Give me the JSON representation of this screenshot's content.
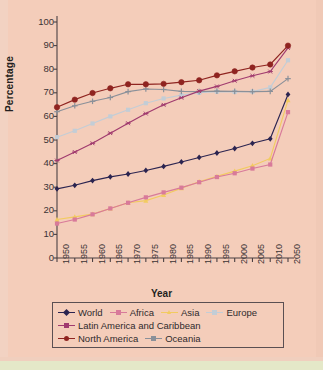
{
  "chart_data": {
    "type": "line",
    "title": "",
    "xlabel": "Year",
    "ylabel": "Percentage",
    "ylim": [
      0,
      100
    ],
    "ytick_step": 10,
    "yticks": [
      0,
      10,
      20,
      30,
      40,
      50,
      60,
      70,
      80,
      90,
      100
    ],
    "grid": false,
    "legend_position": "bottom",
    "categories": [
      "1950",
      "1955",
      "1960",
      "1965",
      "1970",
      "1975",
      "1980",
      "1985",
      "1990",
      "1995",
      "2000",
      "2005",
      "2010",
      "2050"
    ],
    "series": [
      {
        "name": "World",
        "color": "#2b2450",
        "marker": "diamond",
        "values": [
          29.3,
          30.8,
          32.8,
          34.4,
          35.6,
          37.1,
          38.8,
          40.7,
          42.6,
          44.5,
          46.4,
          48.6,
          50.5,
          69.3
        ]
      },
      {
        "name": "Africa",
        "color": "#d87a9a",
        "marker": "square",
        "values": [
          14.6,
          16.3,
          18.5,
          21.0,
          23.4,
          25.7,
          27.8,
          29.8,
          32.1,
          34.3,
          35.9,
          37.9,
          39.6,
          61.8
        ]
      },
      {
        "name": "Asia",
        "color": "#f2cb60",
        "marker": "triangle",
        "values": [
          16.3,
          17.4,
          18.6,
          21.0,
          23.4,
          24.3,
          26.7,
          29.6,
          32.3,
          34.6,
          36.8,
          39.1,
          42.2,
          66.9
        ]
      },
      {
        "name": "Europe",
        "color": "#c3cdd6",
        "marker": "square",
        "values": [
          51.2,
          53.9,
          57.0,
          60.0,
          62.8,
          65.6,
          67.6,
          69.0,
          70.0,
          70.5,
          70.4,
          70.5,
          72.3,
          83.8
        ]
      },
      {
        "name": "Latin America and Caribbean",
        "color": "#a03a6e",
        "marker": "star",
        "values": [
          41.3,
          44.9,
          48.6,
          52.9,
          57.1,
          61.2,
          64.9,
          67.9,
          70.7,
          72.7,
          75.1,
          77.2,
          79.0,
          89.0
        ]
      },
      {
        "name": "North America",
        "color": "#8f2420",
        "marker": "circle",
        "values": [
          63.9,
          67.1,
          69.9,
          71.9,
          73.6,
          73.6,
          73.8,
          74.5,
          75.3,
          77.4,
          79.1,
          80.7,
          82.0,
          90.0
        ]
      },
      {
        "name": "Oceania",
        "color": "#8a9099",
        "marker": "plus",
        "values": [
          62.0,
          64.5,
          66.4,
          68.0,
          70.5,
          71.6,
          71.4,
          70.6,
          70.5,
          70.7,
          70.6,
          70.5,
          70.6,
          76.0
        ]
      }
    ]
  },
  "axes": {
    "y_title": "Percentage",
    "x_title": "Year"
  },
  "legend": {
    "rows": [
      [
        {
          "label": "World",
          "color": "#2b2450",
          "marker": "diamond"
        },
        {
          "label": "Africa",
          "color": "#d87a9a",
          "marker": "square"
        },
        {
          "label": "Asia",
          "color": "#f2cb60",
          "marker": "triangle"
        },
        {
          "label": "Europe",
          "color": "#c3cdd6",
          "marker": "square"
        }
      ],
      [
        {
          "label": "Latin America and Caribbean",
          "color": "#a03a6e",
          "marker": "star"
        }
      ],
      [
        {
          "label": "North America",
          "color": "#8f2420",
          "marker": "circle"
        },
        {
          "label": "Oceania",
          "color": "#8a9099",
          "marker": "plus"
        }
      ]
    ]
  },
  "colors": {
    "background": "#f4cdba",
    "axis": "#4a4042",
    "text": "#2f2a2c"
  }
}
